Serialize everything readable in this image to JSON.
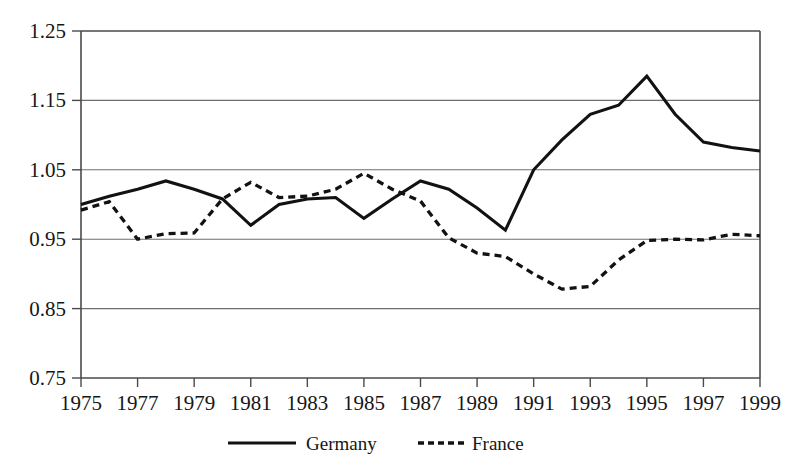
{
  "chart_data": {
    "type": "line",
    "title": "",
    "subtitle": "",
    "xlabel": "",
    "ylabel": "",
    "xlim": [
      1975,
      1999
    ],
    "ylim": [
      0.75,
      1.25
    ],
    "grid": true,
    "legend_position": "bottom",
    "x": [
      1975,
      1976,
      1977,
      1978,
      1979,
      1980,
      1981,
      1982,
      1983,
      1984,
      1985,
      1986,
      1987,
      1988,
      1989,
      1990,
      1991,
      1992,
      1993,
      1994,
      1995,
      1996,
      1997,
      1998,
      1999
    ],
    "x_tick_labels": [
      "1975",
      "1977",
      "1979",
      "1981",
      "1983",
      "1985",
      "1987",
      "1989",
      "1991",
      "1993",
      "1995",
      "1997",
      "1999"
    ],
    "x_tick_values": [
      1975,
      1977,
      1979,
      1981,
      1983,
      1985,
      1987,
      1989,
      1991,
      1993,
      1995,
      1997,
      1999
    ],
    "y_tick_labels": [
      "1.25",
      "1.15",
      "1.05",
      "0.95",
      "0.85",
      "0.75"
    ],
    "y_tick_values": [
      1.25,
      1.15,
      1.05,
      0.95,
      0.85,
      0.75
    ],
    "series": [
      {
        "name": "Germany",
        "style": "solid",
        "color": "#121212",
        "values": [
          1.0,
          1.012,
          1.022,
          1.034,
          1.022,
          1.008,
          0.97,
          1.0,
          1.008,
          1.01,
          0.98,
          1.008,
          1.034,
          1.022,
          0.995,
          0.963,
          1.05,
          1.093,
          1.13,
          1.143,
          1.185,
          1.13,
          1.09,
          1.082,
          1.077
        ]
      },
      {
        "name": "France",
        "style": "dashed",
        "color": "#121212",
        "values": [
          0.992,
          1.004,
          0.95,
          0.958,
          0.959,
          1.008,
          1.032,
          1.01,
          1.012,
          1.022,
          1.045,
          1.022,
          1.005,
          0.952,
          0.93,
          0.925,
          0.9,
          0.878,
          0.882,
          0.92,
          0.948,
          0.95,
          0.949,
          0.957,
          0.955
        ]
      }
    ]
  },
  "legend": {
    "items": [
      {
        "label": "Germany",
        "style": "solid"
      },
      {
        "label": "France",
        "style": "dashed"
      }
    ]
  }
}
